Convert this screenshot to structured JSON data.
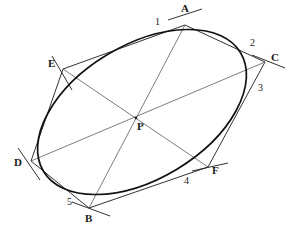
{
  "figure": {
    "canvas": {
      "width": 294,
      "height": 228
    },
    "colors": {
      "background": "#ffffff",
      "conic_stroke": "#111111",
      "hexagon_stroke": "#1a1a1a",
      "diagonal_stroke": "#5a5a5a",
      "label_text": "#1a1a1a"
    },
    "conic": {
      "type": "ellipse",
      "center_x": 142,
      "center_y": 112,
      "semi_major": 115,
      "semi_minor": 67,
      "rotation_deg": -31
    },
    "vertices": [
      {
        "id": "A",
        "label": "A",
        "x": 185,
        "y": 25,
        "label_x": 181,
        "label_y": 3,
        "tick_angle_deg": -18
      },
      {
        "id": "C",
        "label": "C",
        "x": 265,
        "y": 62,
        "label_x": 271,
        "label_y": 52,
        "tick_angle_deg": 14
      },
      {
        "id": "F",
        "label": "F",
        "x": 208,
        "y": 167,
        "label_x": 212,
        "label_y": 165,
        "tick_angle_deg": -9
      },
      {
        "id": "B",
        "label": "B",
        "x": 89,
        "y": 208,
        "label_x": 85,
        "label_y": 213,
        "tick_angle_deg": 20
      },
      {
        "id": "D",
        "label": "D",
        "x": 31,
        "y": 161,
        "label_x": 14,
        "label_y": 157,
        "tick_angle_deg": 58
      },
      {
        "id": "E",
        "label": "E",
        "x": 63,
        "y": 69,
        "label_x": 48,
        "label_y": 58,
        "tick_angle_deg": 60
      }
    ],
    "center_point": {
      "id": "P",
      "label": "P",
      "x": 136,
      "y": 118,
      "label_x": 137,
      "label_y": 121
    },
    "tangency_labels": [
      {
        "label": "1",
        "x": 155,
        "y": 17
      },
      {
        "label": "2",
        "x": 250,
        "y": 38
      },
      {
        "label": "3",
        "x": 258,
        "y": 83
      },
      {
        "label": "4",
        "x": 184,
        "y": 176
      },
      {
        "label": "5",
        "x": 67,
        "y": 197
      }
    ],
    "hexagon_sides": [
      {
        "name": "side-E-A",
        "from": "E",
        "to": "A"
      },
      {
        "name": "side-A-C",
        "from": "A",
        "to": "C"
      },
      {
        "name": "side-C-F",
        "from": "C",
        "to": "F"
      },
      {
        "name": "side-F-B",
        "from": "F",
        "to": "B"
      },
      {
        "name": "side-B-D",
        "from": "B",
        "to": "D"
      },
      {
        "name": "side-D-E",
        "from": "D",
        "to": "E"
      }
    ],
    "diagonals": [
      {
        "name": "diagonal-A-B",
        "from": "A",
        "to": "B"
      },
      {
        "name": "diagonal-C-D",
        "from": "C",
        "to": "D"
      },
      {
        "name": "diagonal-E-F",
        "from": "E",
        "to": "F"
      }
    ]
  }
}
